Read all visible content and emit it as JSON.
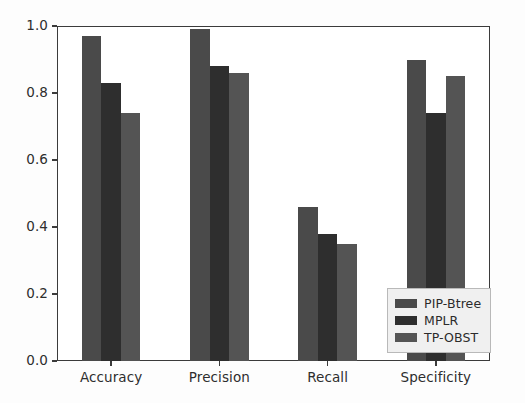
{
  "chart_data": {
    "type": "bar",
    "title": "",
    "xlabel": "",
    "ylabel": "",
    "categories": [
      "Accuracy",
      "Precision",
      "Recall",
      "Specificity"
    ],
    "series": [
      {
        "name": "PIP-Btree",
        "color": "#4a4a4a",
        "values": [
          0.97,
          0.99,
          0.46,
          0.9
        ]
      },
      {
        "name": "MPLR",
        "color": "#2e2e2e",
        "values": [
          0.83,
          0.88,
          0.38,
          0.74
        ]
      },
      {
        "name": "TP-OBST",
        "color": "#545454",
        "values": [
          0.74,
          0.86,
          0.35,
          0.85
        ]
      }
    ],
    "ylim": [
      0.0,
      1.0
    ],
    "ytick_labels": [
      "0.0",
      "0.2",
      "0.4",
      "0.6",
      "0.8",
      "1.0"
    ],
    "ytick_values": [
      0.0,
      0.2,
      0.4,
      0.6,
      0.8,
      1.0
    ],
    "grid": false,
    "legend_position": "lower right",
    "legend_entries": [
      "PIP-Btree",
      "MPLR",
      "TP-OBST"
    ]
  }
}
